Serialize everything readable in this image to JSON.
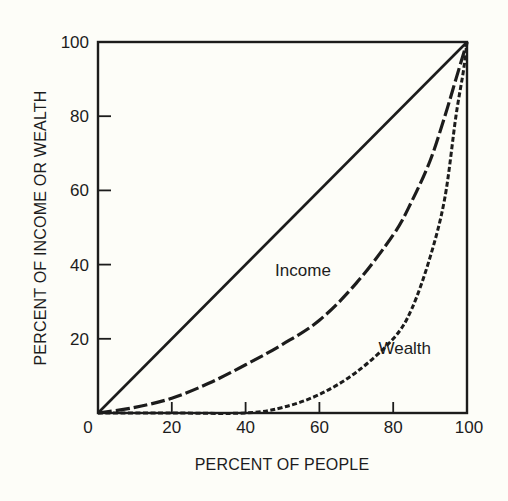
{
  "chart_data": {
    "type": "line",
    "title": "",
    "xlabel": "PERCENT OF PEOPLE",
    "ylabel": "PERCENT OF INCOME OR WEALTH",
    "xlim": [
      0,
      100
    ],
    "ylim": [
      0,
      100
    ],
    "grid": false,
    "legend": "inline labels",
    "x_ticks": [
      0,
      20,
      40,
      60,
      80,
      100
    ],
    "y_ticks": [
      20,
      40,
      60,
      80,
      100
    ],
    "x_tick_labels": [
      "0",
      "20",
      "40",
      "60",
      "80",
      "100"
    ],
    "y_tick_labels": [
      "20",
      "40",
      "60",
      "80",
      "100"
    ],
    "series": [
      {
        "name": "Equality line",
        "style": "solid",
        "label": "",
        "x": [
          0,
          100
        ],
        "y": [
          0,
          100
        ]
      },
      {
        "name": "Income",
        "style": "long-dash",
        "label": "Income",
        "x": [
          0,
          10,
          20,
          30,
          40,
          50,
          60,
          70,
          80,
          85,
          90,
          94,
          97,
          100
        ],
        "y": [
          0,
          1.5,
          4,
          8,
          13,
          18.5,
          25,
          35,
          48,
          57,
          68,
          80,
          90,
          100
        ]
      },
      {
        "name": "Wealth",
        "style": "short-dash",
        "label": "Wealth",
        "x": [
          0,
          20,
          40,
          50,
          60,
          70,
          80,
          85,
          90,
          94,
          97,
          99,
          100
        ],
        "y": [
          0,
          0,
          0,
          1.5,
          5,
          11,
          20,
          28,
          42,
          58,
          80,
          92,
          100
        ]
      }
    ],
    "annotations": [
      {
        "text": "Income",
        "x": 48,
        "y": 37
      },
      {
        "text": "Wealth",
        "x": 76,
        "y": 16
      }
    ]
  }
}
